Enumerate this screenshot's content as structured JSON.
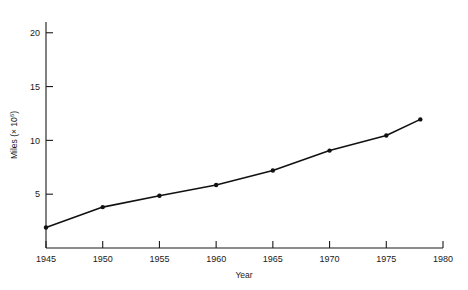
{
  "chart_data": {
    "type": "line",
    "title": "",
    "subtitle": "",
    "xlabel": "Year",
    "ylabel": "Miles (× 10⁶)",
    "ylabel_base": "Miles (× 10",
    "ylabel_exponent": "6",
    "ylabel_close": ")",
    "xlim": [
      1945,
      1980
    ],
    "ylim": [
      0,
      21
    ],
    "grid": false,
    "legend": null,
    "xticks": [
      1945,
      1950,
      1955,
      1960,
      1965,
      1970,
      1975,
      1980
    ],
    "xtick_labels": [
      "1945",
      "1950",
      "1955",
      "1960",
      "1965",
      "1970",
      "1975",
      "1980"
    ],
    "yticks": [
      5,
      10,
      15,
      20
    ],
    "ytick_labels": [
      "5",
      "10",
      "15",
      "20"
    ],
    "series": [
      {
        "name": "Miles",
        "x": [
          1945,
          1950,
          1955,
          1960,
          1965,
          1970,
          1975,
          1978
        ],
        "values": [
          1.9,
          3.8,
          4.85,
          5.85,
          7.2,
          9.05,
          10.45,
          11.95
        ]
      }
    ]
  },
  "colors": {
    "line": "#111111",
    "marker": "#111111",
    "axis": "#1a1a1a",
    "background": "#ffffff"
  }
}
